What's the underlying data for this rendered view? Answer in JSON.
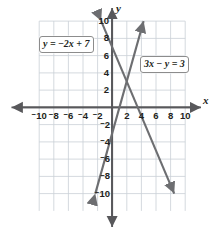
{
  "figure": {
    "kind": "coordinate-plane-graph",
    "background_color": "#ffffff",
    "grid_color": "#c9cfd6",
    "axis_color": "#58585b",
    "line_color": "#6d6e71",
    "text_color": "#231f20",
    "bottom_artifact": ""
  },
  "axes": {
    "x_letter": "x",
    "y_letter": "y",
    "x_ticks": [
      "-10",
      "-8",
      "-6",
      "-4",
      "-2",
      "2",
      "4",
      "6",
      "8",
      "10"
    ],
    "y_ticks": [
      "10",
      "8",
      "6",
      "4",
      "2",
      "-2",
      "-4",
      "-6",
      "-8",
      "-10"
    ],
    "x_min": -11,
    "x_max": 11,
    "y_min": -11,
    "y_max": 11,
    "grid_step": 2,
    "grid": true
  },
  "labels": {
    "line1": {
      "lhs": "y",
      "op": "=",
      "rhs": "-2x + 7",
      "full": "y = -2x + 7"
    },
    "line2": {
      "lhs": "3x",
      "op": "-",
      "rhs": "y = 3",
      "full": "3x - y = 3"
    }
  },
  "chart_data": {
    "type": "line",
    "title": "",
    "xlabel": "x",
    "ylabel": "y",
    "xlim": [
      -11,
      11
    ],
    "ylim": [
      -11,
      11
    ],
    "grid": true,
    "grid_step": 2,
    "legend": "inline-callout-boxes",
    "xticks": [
      -10,
      -8,
      -6,
      -4,
      -2,
      2,
      4,
      6,
      8,
      10
    ],
    "yticks": [
      10,
      8,
      6,
      4,
      2,
      -2,
      -4,
      -6,
      -8,
      -10
    ],
    "series": [
      {
        "name": "y = -2x + 7",
        "equation": "y = -2x + 7",
        "slope": -2,
        "intercept": 7,
        "segment_from": [
          -1.5,
          10.0
        ],
        "segment_to": [
          8.5,
          -10.0
        ],
        "arrow_both_ends": true,
        "label_position": "upper-left"
      },
      {
        "name": "3x - y = 3",
        "equation": "3x - y = 3",
        "slope": 3,
        "intercept": -3,
        "segment_from": [
          -2.3,
          -10.0
        ],
        "segment_to": [
          4.3,
          10.0
        ],
        "arrow_both_ends": true,
        "label_position": "upper-right"
      }
    ],
    "intersection": [
      2,
      3
    ],
    "annotations": [
      "y = -2x + 7",
      "3x - y = 3"
    ]
  }
}
